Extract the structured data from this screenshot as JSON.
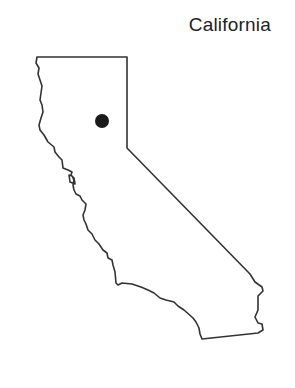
{
  "map": {
    "title": "California",
    "region": "California",
    "marker": {
      "label": "location-marker",
      "color": "#1a1a1a",
      "x": 102,
      "y": 121,
      "r": 7
    },
    "outline_color": "#333333",
    "background": "#ffffff"
  }
}
